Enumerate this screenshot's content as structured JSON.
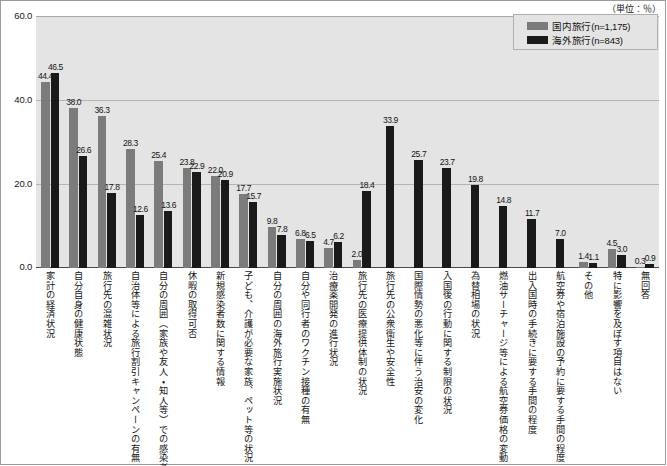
{
  "unit_note": "（単位：％）",
  "legend": {
    "items": [
      {
        "label": "国内旅行(n=1,175)",
        "color": "#7b7b7b",
        "key": "domestic"
      },
      {
        "label": "海外旅行(n=843)",
        "color": "#1a1a1a",
        "key": "overseas"
      }
    ]
  },
  "axis": {
    "y_ticks": [
      "0.0",
      "20.0",
      "40.0",
      "60.0"
    ]
  },
  "chart_data": {
    "type": "bar",
    "title": "",
    "subtitle": "",
    "xlabel": "",
    "ylabel": "",
    "ylim": [
      0,
      60
    ],
    "y_ticks": [
      0,
      20,
      40,
      60
    ],
    "grid": true,
    "legend_position": "top-right",
    "unit": "%",
    "orientation": "vertical",
    "grouping": "grouped",
    "categories": [
      "家計の経済状況",
      "自分自身の健康状態",
      "旅行先の混雑状況",
      "自治体等による旅行割引キャンペーンの有無",
      "自分の周囲（家族や友人・知人等）での感染者の発生",
      "休暇の取得可否",
      "新規感染者数に関する情報",
      "子ども、介護が必要な家族、ペット等の状況",
      "自分の周囲の海外旅行実施状況",
      "自分や同行者のワクチン接種の有無",
      "治療薬開発の進行状況",
      "旅行先の医療提供体制の状況",
      "旅行先の公衆衛生や安全性",
      "国際情勢の悪化等に伴う治安の変化",
      "入国後の行動に関する制限の状況",
      "為替相場の状況",
      "燃油サーチャージ等による航空券価格の変動",
      "出入国時の手続きに要する手間の程度",
      "航空券や宿泊施設の予約に要する手間の程度",
      "その他",
      "特に影響を及ぼす項目はない",
      "無回答"
    ],
    "series": [
      {
        "name": "国内旅行(n=1,175)",
        "color": "#7b7b7b",
        "values": [
          44.4,
          38.0,
          36.3,
          28.3,
          25.4,
          23.8,
          22.0,
          17.7,
          9.8,
          6.8,
          4.7,
          2.0,
          null,
          null,
          null,
          null,
          null,
          null,
          null,
          1.4,
          4.5,
          0.3
        ]
      },
      {
        "name": "海外旅行(n=843)",
        "color": "#1a1a1a",
        "values": [
          46.5,
          26.6,
          17.8,
          12.6,
          13.6,
          22.9,
          20.9,
          15.7,
          7.8,
          6.5,
          6.2,
          18.4,
          33.9,
          25.7,
          23.7,
          19.8,
          14.8,
          11.7,
          7.0,
          1.1,
          3.0,
          0.9
        ]
      }
    ],
    "value_labels": {
      "国内旅行(n=1,175)": [
        "44.4",
        "38.0",
        "36.3",
        "28.3",
        "25.4",
        "23.8",
        "22.0",
        "17.7",
        "9.8",
        "6.8",
        "4.7",
        "2.0",
        "",
        "",
        "",
        "",
        "",
        "",
        "",
        "1.4",
        "4.5",
        "0.3"
      ],
      "海外旅行(n=843)": [
        "46.5",
        "26.6",
        "17.8",
        "12.6",
        "13.6",
        "22.9",
        "20.9",
        "15.7",
        "7.8",
        "6.5",
        "6.2",
        "18.4",
        "33.9",
        "25.7",
        "23.7",
        "19.8",
        "14.8",
        "11.7",
        "7.0",
        "1.1",
        "3.0",
        "0.9"
      ]
    }
  }
}
